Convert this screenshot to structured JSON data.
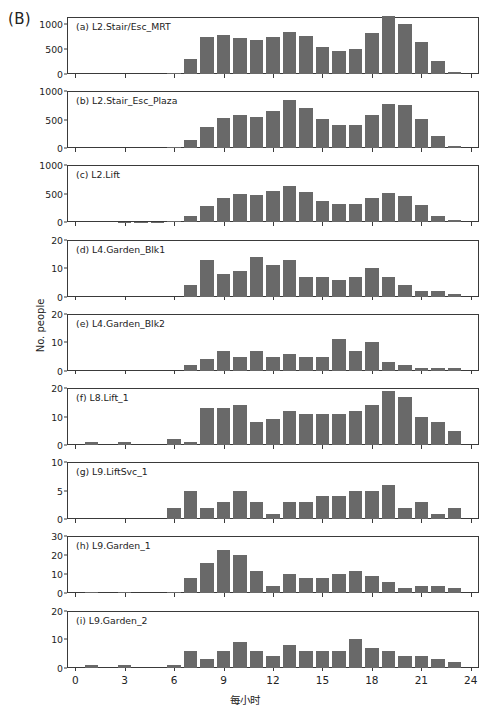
{
  "figure": {
    "panel_letter": "(B)",
    "ylabel": "No. people",
    "xlabel": "每小时",
    "bar_color": "#696969",
    "axis_color": "#3a3a3a",
    "background": "#ffffff"
  },
  "chart_data": [
    {
      "type": "bar",
      "title": "(a) L2.Stair/Esc_MRT",
      "xlabel": "每小时",
      "ylabel": "No. people",
      "xlim": [
        -0.5,
        24.5
      ],
      "ylim": [
        0,
        1150
      ],
      "yticks": [
        0,
        500,
        1000
      ],
      "xticks": [
        0,
        3,
        6,
        9,
        12,
        15,
        18,
        21,
        24
      ],
      "grid": false,
      "x": [
        0,
        1,
        2,
        3,
        4,
        5,
        6,
        7,
        8,
        9,
        10,
        11,
        12,
        13,
        14,
        15,
        16,
        17,
        18,
        19,
        20,
        21,
        22,
        23
      ],
      "values": [
        0,
        0,
        0,
        0,
        0,
        0,
        8,
        300,
        750,
        790,
        725,
        680,
        755,
        845,
        760,
        545,
        465,
        495,
        835,
        1170,
        1010,
        645,
        270,
        45
      ]
    },
    {
      "type": "bar",
      "title": "(b) L2.Stair_Esc_Plaza",
      "xlabel": "每小时",
      "ylabel": "No. people",
      "xlim": [
        -0.5,
        24.5
      ],
      "ylim": [
        0,
        1000
      ],
      "yticks": [
        0,
        500,
        1000
      ],
      "xticks": [
        0,
        3,
        6,
        9,
        12,
        15,
        18,
        21,
        24
      ],
      "grid": false,
      "x": [
        0,
        1,
        2,
        3,
        4,
        5,
        6,
        7,
        8,
        9,
        10,
        11,
        12,
        13,
        14,
        15,
        16,
        17,
        18,
        19,
        20,
        21,
        22,
        23
      ],
      "values": [
        0,
        0,
        0,
        0,
        0,
        0,
        12,
        140,
        375,
        530,
        580,
        555,
        645,
        845,
        700,
        515,
        405,
        400,
        590,
        775,
        760,
        510,
        210,
        30
      ]
    },
    {
      "type": "bar",
      "title": "(c) L2.Lift",
      "xlabel": "每小时",
      "ylabel": "No. people",
      "xlim": [
        -0.5,
        24.5
      ],
      "ylim": [
        0,
        1000
      ],
      "yticks": [
        0,
        500,
        1000
      ],
      "xticks": [
        0,
        3,
        6,
        9,
        12,
        15,
        18,
        21,
        24
      ],
      "grid": false,
      "x": [
        0,
        1,
        2,
        3,
        4,
        5,
        6,
        7,
        8,
        9,
        10,
        11,
        12,
        13,
        14,
        15,
        16,
        17,
        18,
        19,
        20,
        21,
        22,
        23
      ],
      "values": [
        0,
        0,
        0,
        4,
        2,
        8,
        25,
        105,
        290,
        430,
        500,
        485,
        545,
        635,
        540,
        375,
        315,
        330,
        425,
        510,
        470,
        300,
        115,
        35
      ]
    },
    {
      "type": "bar",
      "title": "(d) L4.Garden_Blk1",
      "xlabel": "每小时",
      "ylabel": "No. people",
      "xlim": [
        -0.5,
        24.5
      ],
      "ylim": [
        0,
        20
      ],
      "yticks": [
        0,
        10,
        20
      ],
      "xticks": [
        0,
        3,
        6,
        9,
        12,
        15,
        18,
        21,
        24
      ],
      "grid": false,
      "x": [
        0,
        1,
        2,
        3,
        4,
        5,
        6,
        7,
        8,
        9,
        10,
        11,
        12,
        13,
        14,
        15,
        16,
        17,
        18,
        19,
        20,
        21,
        22,
        23
      ],
      "values": [
        0,
        0,
        0,
        0,
        0,
        0,
        0,
        4,
        13,
        8,
        9,
        14,
        11,
        13,
        7,
        7,
        6,
        7,
        10,
        7,
        4,
        2,
        2,
        1
      ]
    },
    {
      "type": "bar",
      "title": "(e) L4.Garden_Blk2",
      "xlabel": "每小时",
      "ylabel": "No. people",
      "xlim": [
        -0.5,
        24.5
      ],
      "ylim": [
        0,
        20
      ],
      "yticks": [
        0,
        10,
        20
      ],
      "xticks": [
        0,
        3,
        6,
        9,
        12,
        15,
        18,
        21,
        24
      ],
      "grid": false,
      "x": [
        0,
        1,
        2,
        3,
        4,
        5,
        6,
        7,
        8,
        9,
        10,
        11,
        12,
        13,
        14,
        15,
        16,
        17,
        18,
        19,
        20,
        21,
        22,
        23
      ],
      "values": [
        0,
        0,
        0,
        0,
        0,
        0,
        0,
        2,
        4,
        7,
        5,
        7,
        5,
        6,
        5,
        5,
        11,
        7,
        10,
        3,
        2,
        1,
        1,
        1
      ]
    },
    {
      "type": "bar",
      "title": "(f) L8.Lift_1",
      "xlabel": "每小时",
      "ylabel": "No. people",
      "xlim": [
        -0.5,
        24.5
      ],
      "ylim": [
        0,
        20
      ],
      "yticks": [
        0,
        10,
        20
      ],
      "xticks": [
        0,
        3,
        6,
        9,
        12,
        15,
        18,
        21,
        24
      ],
      "grid": false,
      "x": [
        0,
        1,
        2,
        3,
        4,
        5,
        6,
        7,
        8,
        9,
        10,
        11,
        12,
        13,
        14,
        15,
        16,
        17,
        18,
        19,
        20,
        21,
        22,
        23
      ],
      "values": [
        0,
        1,
        0,
        1,
        0,
        0,
        2,
        1,
        13,
        13,
        14,
        8,
        9,
        12,
        11,
        11,
        11,
        12,
        14,
        19,
        17,
        10,
        8,
        5
      ]
    },
    {
      "type": "bar",
      "title": "(g) L9.LiftSvc_1",
      "xlabel": "每小时",
      "ylabel": "No. people",
      "xlim": [
        -0.5,
        24.5
      ],
      "ylim": [
        0,
        10
      ],
      "yticks": [
        0,
        5,
        10
      ],
      "xticks": [
        0,
        3,
        6,
        9,
        12,
        15,
        18,
        21,
        24
      ],
      "grid": false,
      "x": [
        0,
        1,
        2,
        3,
        4,
        5,
        6,
        7,
        8,
        9,
        10,
        11,
        12,
        13,
        14,
        15,
        16,
        17,
        18,
        19,
        20,
        21,
        22,
        23
      ],
      "values": [
        0,
        0,
        0,
        0,
        0,
        0,
        2,
        5,
        2,
        3,
        5,
        3,
        1,
        3,
        3,
        4,
        4,
        5,
        5,
        6,
        2,
        3,
        1,
        2
      ]
    },
    {
      "type": "bar",
      "title": "(h) L9.Garden_1",
      "xlabel": "每小时",
      "ylabel": "No. people",
      "xlim": [
        -0.5,
        24.5
      ],
      "ylim": [
        0,
        30
      ],
      "yticks": [
        0,
        10,
        20,
        30
      ],
      "xticks": [
        0,
        3,
        6,
        9,
        12,
        15,
        18,
        21,
        24
      ],
      "grid": false,
      "x": [
        0,
        1,
        2,
        3,
        4,
        5,
        6,
        7,
        8,
        9,
        10,
        11,
        12,
        13,
        14,
        15,
        16,
        17,
        18,
        19,
        20,
        21,
        22,
        23
      ],
      "values": [
        0,
        1,
        0,
        1,
        0,
        0,
        1,
        8,
        16,
        23,
        20,
        12,
        4,
        10,
        8,
        8,
        10,
        12,
        9,
        6,
        3,
        4,
        4,
        3
      ]
    },
    {
      "type": "bar",
      "title": "(i) L9.Garden_2",
      "xlabel": "每小时",
      "ylabel": "No. people",
      "xlim": [
        -0.5,
        24.5
      ],
      "ylim": [
        0,
        20
      ],
      "yticks": [
        0,
        10,
        20
      ],
      "xticks": [
        0,
        3,
        6,
        9,
        12,
        15,
        18,
        21,
        24
      ],
      "grid": false,
      "x": [
        0,
        1,
        2,
        3,
        4,
        5,
        6,
        7,
        8,
        9,
        10,
        11,
        12,
        13,
        14,
        15,
        16,
        17,
        18,
        19,
        20,
        21,
        22,
        23
      ],
      "values": [
        0,
        1,
        0,
        1,
        0,
        0,
        1,
        6,
        3,
        6,
        9,
        6,
        4,
        8,
        6,
        6,
        6,
        10,
        7,
        6,
        4,
        4,
        3,
        2
      ]
    }
  ]
}
